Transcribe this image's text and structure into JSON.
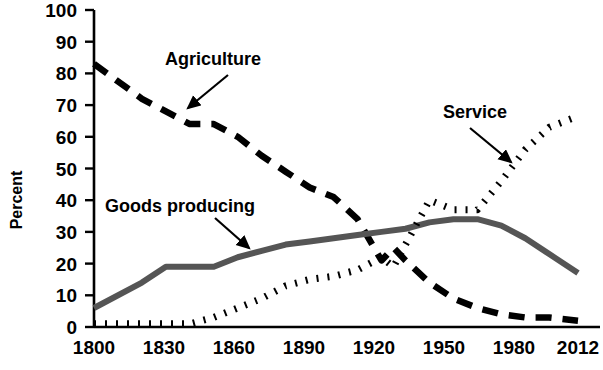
{
  "chart_data": {
    "type": "line",
    "title": "",
    "subtitle": "",
    "xlabel": "",
    "ylabel": "Percent",
    "xlim": [
      1810,
      2012
    ],
    "ylim": [
      0,
      100
    ],
    "grid": false,
    "legend_position": "inline-annotations",
    "x_ticks": [
      "1800",
      "1830",
      "1860",
      "1890",
      "1920",
      "1950",
      "1980",
      "2012"
    ],
    "y_ticks": [
      "0",
      "10",
      "20",
      "30",
      "40",
      "50",
      "60",
      "70",
      "80",
      "90",
      "100"
    ],
    "series": [
      {
        "name": "Agriculture",
        "style": "dashed",
        "color": "#000000",
        "x": [
          1810,
          1830,
          1840,
          1850,
          1860,
          1870,
          1880,
          1890,
          1900,
          1910,
          1920,
          1930,
          1935,
          1940,
          1950,
          1960,
          1970,
          1980,
          1990,
          2000,
          2012
        ],
        "values": [
          83,
          72,
          68,
          64,
          64,
          60,
          54,
          49,
          44,
          41,
          34,
          21,
          25,
          21,
          14,
          9,
          6,
          4,
          3,
          3,
          2
        ]
      },
      {
        "name": "Goods producing",
        "style": "solid",
        "color": "#555555",
        "x": [
          1810,
          1830,
          1840,
          1850,
          1860,
          1870,
          1880,
          1890,
          1900,
          1910,
          1920,
          1930,
          1940,
          1950,
          1960,
          1970,
          1980,
          1990,
          2000,
          2012
        ],
        "values": [
          6,
          14,
          19,
          19,
          19,
          22,
          24,
          26,
          27,
          28,
          29,
          30,
          31,
          33,
          34,
          34,
          32,
          28,
          23,
          17
        ]
      },
      {
        "name": "Service",
        "style": "dotted",
        "color": "#000000",
        "x": [
          1810,
          1830,
          1840,
          1850,
          1860,
          1870,
          1880,
          1890,
          1900,
          1910,
          1920,
          1930,
          1935,
          1940,
          1950,
          1960,
          1970,
          1980,
          1990,
          2000,
          2012
        ],
        "values": [
          1,
          1,
          1,
          1,
          3,
          6,
          9,
          13,
          15,
          16,
          18,
          22,
          19,
          26,
          40,
          37,
          37,
          46,
          56,
          63,
          66.5
        ]
      }
    ],
    "annotations": [
      {
        "label": "Agriculture",
        "label_x": 165,
        "label_y": 65,
        "arrow_from_x": 228,
        "arrow_from_y": 75,
        "arrow_to_x": 188,
        "arrow_to_y": 108
      },
      {
        "label": "Goods producing",
        "label_x": 105,
        "label_y": 212,
        "arrow_from_x": 215,
        "arrow_from_y": 218,
        "arrow_to_x": 249,
        "arrow_to_y": 248
      },
      {
        "label": "Service",
        "label_x": 443,
        "label_y": 118,
        "arrow_from_x": 470,
        "arrow_from_y": 128,
        "arrow_to_x": 511,
        "arrow_to_y": 162
      }
    ]
  }
}
